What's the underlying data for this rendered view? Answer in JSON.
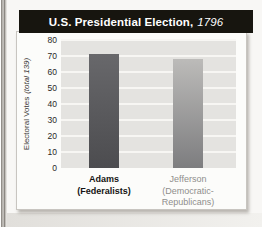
{
  "header": {
    "title_main": "U.S. Presidential Election,",
    "title_year": "1796",
    "bg": "#17150f",
    "text_color": "#ffffff"
  },
  "y_axis": {
    "label_main": "Electoral Votes",
    "label_note": "(total 139)"
  },
  "x_labels": [
    {
      "lines": [
        "Adams",
        "(Federalists)"
      ],
      "bold": true,
      "color": "#151413"
    },
    {
      "lines": [
        "Jefferson",
        "(Democratic-",
        "Republicans)"
      ],
      "bold": false,
      "color": "#8f8e8c"
    }
  ],
  "colors": {
    "plot_bg": "#e4e3e0",
    "gridline": "#f7f6f3",
    "card_bg": "#fcfcfa",
    "header_bg": "#17150f"
  },
  "chart_data": {
    "type": "bar",
    "title": "U.S. Presidential Election, 1796",
    "ylabel": "Electoral Votes (total 139)",
    "xlabel": "",
    "categories": [
      "Adams (Federalists)",
      "Jefferson (Democratic-Republicans)"
    ],
    "values": [
      71,
      68
    ],
    "ylim": [
      0,
      80
    ],
    "yticks": [
      0,
      10,
      20,
      30,
      40,
      50,
      60,
      70,
      80
    ],
    "grid": true,
    "legend_position": "none",
    "bar_colors": [
      [
        "#68686b",
        "#4c4c4f"
      ],
      [
        "#bcbbb9",
        "#7d7d7f"
      ]
    ]
  }
}
